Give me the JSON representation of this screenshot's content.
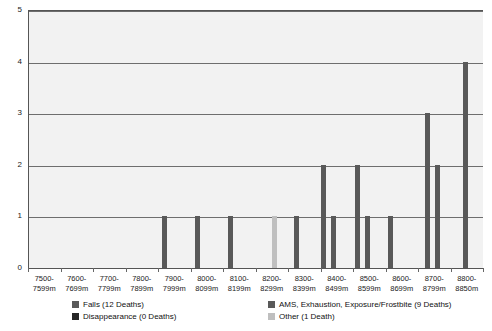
{
  "chart_data": {
    "type": "bar",
    "title": "",
    "subtitle": "",
    "xlabel": "",
    "ylabel": "",
    "ylim": [
      0,
      5
    ],
    "y_ticks": [
      "0",
      "1",
      "2",
      "3",
      "4",
      "5"
    ],
    "grid": true,
    "legend_position": "bottom",
    "categories": [
      "7500-7599m",
      "7600-7699m",
      "7700-7799m",
      "7800-7899m",
      "7900-7999m",
      "8000-8099m",
      "8100-8199m",
      "8200-8299m",
      "8300-8399m",
      "8400-8499m",
      "8500-8599m",
      "8600-8699m",
      "8700-8799m",
      "8800-8850m"
    ],
    "series": [
      {
        "name": "Falls (12 Deaths)",
        "color": "#595959",
        "values": [
          0,
          0,
          0,
          0,
          1,
          1,
          1,
          0,
          1,
          2,
          2,
          1,
          2,
          4
        ]
      },
      {
        "name": "Disappearance (0 Deaths)",
        "color": "#262626",
        "values": [
          0,
          0,
          0,
          0,
          0,
          0,
          0,
          0,
          0,
          0,
          0,
          0,
          0,
          0
        ]
      },
      {
        "name": "AMS, Exhaustion, Exposure/Frostbite (9 Deaths)",
        "color": "#595959",
        "values": [
          0,
          0,
          0,
          0,
          0,
          0,
          0,
          0,
          1,
          1,
          1,
          0,
          3,
          0
        ]
      },
      {
        "name": "Other (1 Death)",
        "color": "#bfbfbf",
        "values": [
          0,
          0,
          0,
          0,
          0,
          0,
          0,
          1,
          0,
          0,
          0,
          0,
          0,
          0
        ]
      }
    ],
    "bars": [
      {
        "category": "7900-7999m",
        "series": "Falls (12 Deaths)",
        "value": 1,
        "x": 161,
        "color": "#595959"
      },
      {
        "category": "8000-8099m",
        "series": "Falls (12 Deaths)",
        "value": 1,
        "x": 194,
        "color": "#595959"
      },
      {
        "category": "8100-8199m",
        "series": "Falls (12 Deaths)",
        "value": 1,
        "x": 227,
        "color": "#595959"
      },
      {
        "category": "8200-8299m",
        "series": "Other (1 Death)",
        "value": 1,
        "x": 271,
        "color": "#bfbfbf"
      },
      {
        "category": "8300-8399m",
        "series": "Falls (12 Deaths)",
        "value": 1,
        "x": 293,
        "color": "#595959"
      },
      {
        "category": "8400-8499m",
        "series": "Falls (12 Deaths)",
        "value": 2,
        "x": 320,
        "color": "#595959"
      },
      {
        "category": "8400-8499m",
        "series": "AMS, Exhaustion, Exposure/Frostbite (9 Deaths)",
        "value": 1,
        "x": 330,
        "color": "#595959"
      },
      {
        "category": "8500-8599m",
        "series": "Falls (12 Deaths)",
        "value": 2,
        "x": 354,
        "color": "#595959"
      },
      {
        "category": "8500-8599m",
        "series": "AMS, Exhaustion, Exposure/Frostbite (9 Deaths)",
        "value": 1,
        "x": 364,
        "color": "#595959"
      },
      {
        "category": "8600-8699m",
        "series": "Falls (12 Deaths)",
        "value": 1,
        "x": 387,
        "color": "#595959"
      },
      {
        "category": "8700-8799m",
        "series": "AMS, Exhaustion, Exposure/Frostbite (9 Deaths)",
        "value": 3,
        "x": 424,
        "color": "#595959"
      },
      {
        "category": "8700-8799m",
        "series": "Falls (12 Deaths)",
        "value": 2,
        "x": 434,
        "color": "#595959"
      },
      {
        "category": "8800-8850m",
        "series": "Falls (12 Deaths)",
        "value": 4,
        "x": 462,
        "color": "#595959"
      }
    ]
  },
  "legend": {
    "items": [
      {
        "label": "Falls (12 Deaths)",
        "color": "#595959",
        "col": 0,
        "row": 0
      },
      {
        "label": "Disappearance (0 Deaths)",
        "color": "#262626",
        "col": 0,
        "row": 1
      },
      {
        "label": "AMS, Exhaustion, Exposure/Frostbite (9 Deaths)",
        "color": "#595959",
        "col": 1,
        "row": 0
      },
      {
        "label": "Other (1 Death)",
        "color": "#bfbfbf",
        "col": 1,
        "row": 1
      }
    ]
  },
  "colors": {
    "plot_background": "#f2f2f2",
    "gridline": "#6e6e6e",
    "axis": "#555555",
    "text": "#1a1a1a"
  }
}
